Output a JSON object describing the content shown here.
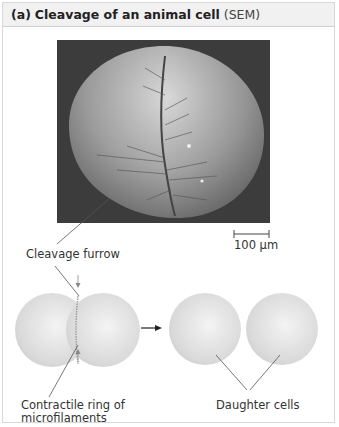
{
  "figure": {
    "panel_letter": "(a)",
    "title": "Cleavage of an animal cell",
    "subtitle": "(SEM)"
  },
  "micrograph": {
    "scale_bar_label": "100 µm",
    "background_color": "#3a3a3a"
  },
  "labels": {
    "cleavage_furrow": "Cleavage furrow",
    "contractile_ring_line1": "Contractile ring of",
    "contractile_ring_line2": "microfilaments",
    "daughter_cells": "Daughter cells"
  },
  "colors": {
    "header_bg": "#f1f1f1",
    "cell_fill": "#e6e6e6",
    "line": "#555555"
  }
}
